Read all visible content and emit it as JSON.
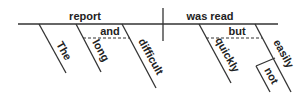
{
  "diagram": {
    "type": "reed-kellogg sentence diagram",
    "subject": "report",
    "verb": "was read",
    "subject_modifiers": [
      "The",
      "long",
      "difficult"
    ],
    "subject_conjunction": "and",
    "verb_modifiers": [
      "quickly",
      "easily"
    ],
    "verb_conjunction": "but",
    "nested_modifier": "not"
  }
}
